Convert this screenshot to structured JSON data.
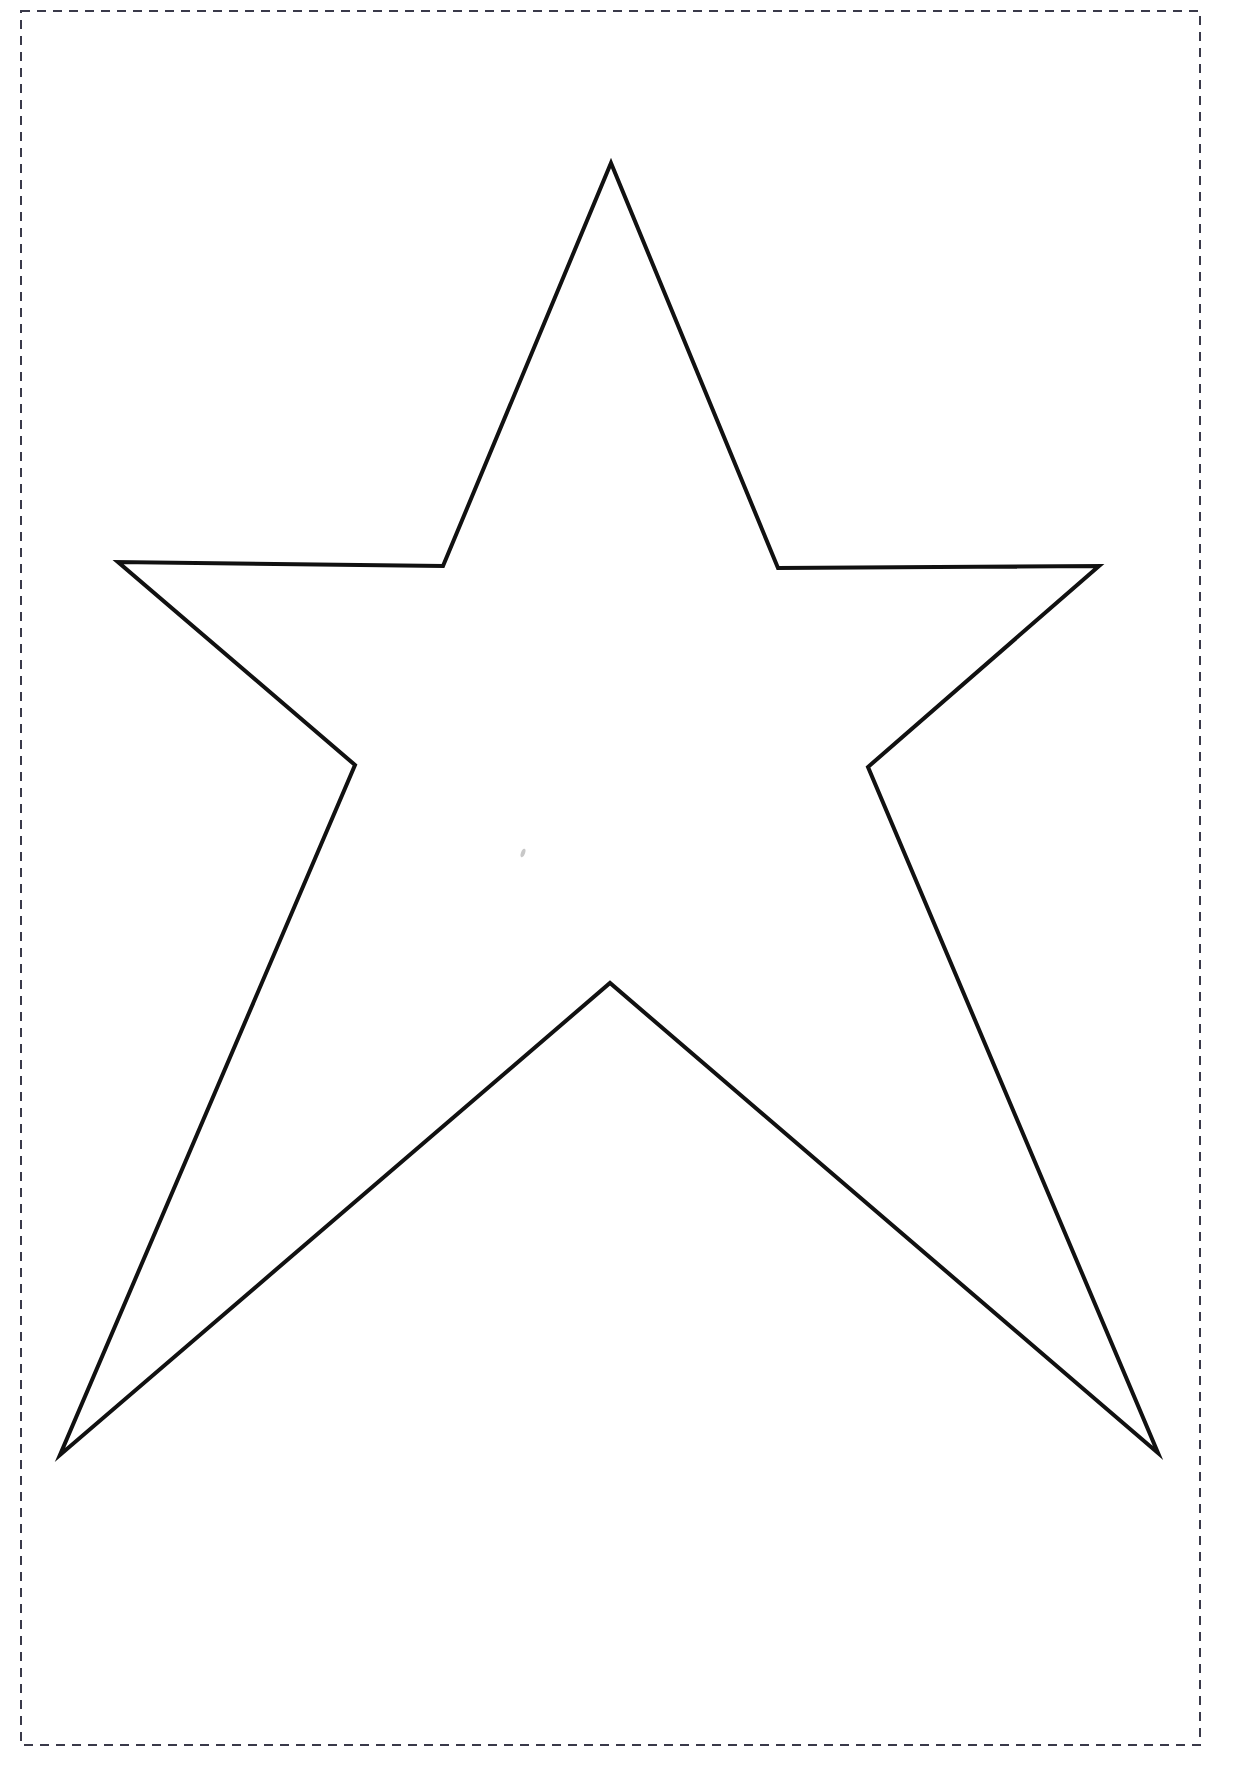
{
  "document": {
    "title": "Star Template Outline",
    "page_width": 1240,
    "page_height": 1781,
    "background_color": "#ffffff",
    "description": "Black line-art outline of a five-pointed star on a white page, enclosed by a dashed rectangular cut/print border."
  },
  "border": {
    "name": "dashed-page-border",
    "style": "dashed",
    "color": "#3a3a4a",
    "stroke_width": 2,
    "dash_pattern": "9 7",
    "x": 21,
    "y": 11,
    "width": 1179,
    "height": 1734,
    "fill": "none"
  },
  "star": {
    "name": "five-pointed-star",
    "stroke_color": "#111111",
    "stroke_width": 4,
    "fill_color": "#ffffff",
    "points_count": 5,
    "outer_points": [
      {
        "label": "top",
        "x": 611,
        "y": 163
      },
      {
        "label": "right",
        "x": 1099,
        "y": 566
      },
      {
        "label": "bottom-right",
        "x": 1158,
        "y": 1453
      },
      {
        "label": "bottom-left",
        "x": 60,
        "y": 1455
      },
      {
        "label": "left",
        "x": 118,
        "y": 562
      }
    ],
    "inner_points": [
      {
        "label": "upper-right-inner",
        "x": 778,
        "y": 568
      },
      {
        "label": "right-inner",
        "x": 868,
        "y": 767
      },
      {
        "label": "bottom-center-inner",
        "x": 610,
        "y": 983
      },
      {
        "label": "left-inner",
        "x": 355,
        "y": 765
      },
      {
        "label": "upper-left-inner",
        "x": 443,
        "y": 566
      }
    ],
    "polygon_points": "611,163 778,568 1099,566 868,767 1158,1453 610,983 60,1455 355,765 118,562 443,566"
  },
  "marks": [
    {
      "name": "stray-pencil-mark",
      "x": 523,
      "y": 853,
      "width": 4,
      "height": 9,
      "color": "#9a9a9a"
    }
  ]
}
